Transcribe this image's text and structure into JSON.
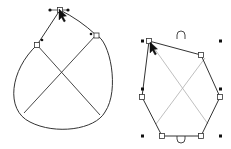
{
  "canvas": {
    "width": 231,
    "height": 149,
    "background": "#ffffff"
  },
  "colors": {
    "stroke": "#333333",
    "guide": "#b8b8b8",
    "handle": "#111111",
    "node_fill": "#ffffff"
  },
  "shapes": [
    {
      "name": "closed-curve-shape",
      "mode": "node-edit"
    },
    {
      "name": "polygon-shape",
      "mode": "selected-transform"
    }
  ]
}
